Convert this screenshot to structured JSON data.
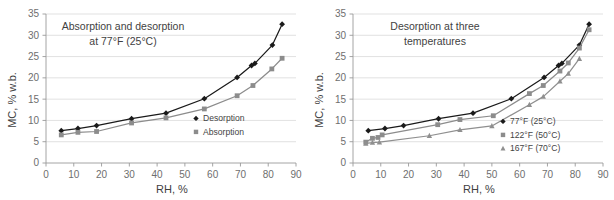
{
  "figure": {
    "width": 614,
    "height": 200,
    "background": "#ffffff"
  },
  "chart_data": [
    {
      "type": "line",
      "panel": "left",
      "title": "Absorption and desorption\nat 77°F (25°C)",
      "title_line1": "Absorption and desorption",
      "title_line2": "at 77°F (25°C)",
      "xlabel": "RH, %",
      "ylabel": "MC, % w.b.",
      "xlim": [
        0,
        90
      ],
      "ylim": [
        0,
        35
      ],
      "xticks": [
        0,
        10,
        20,
        30,
        40,
        50,
        60,
        70,
        80,
        90
      ],
      "yticks": [
        0,
        5,
        10,
        15,
        20,
        25,
        30,
        35
      ],
      "grid": "horizontal",
      "legend_position": "inside-lower-right",
      "series": [
        {
          "name": "Desorption",
          "marker": "diamond",
          "color": "#1a1a1a",
          "points": [
            [
              5.5,
              7.6
            ],
            [
              11.5,
              8.1
            ],
            [
              18.2,
              8.8
            ],
            [
              30.8,
              10.4
            ],
            [
              43.2,
              11.7
            ],
            [
              57.0,
              15.1
            ],
            [
              68.8,
              20.1
            ],
            [
              74.0,
              22.9
            ],
            [
              75.2,
              23.4
            ],
            [
              81.5,
              27.7
            ],
            [
              85.0,
              32.6
            ]
          ]
        },
        {
          "name": "Absorption",
          "marker": "square",
          "color": "#8c8c8c",
          "points": [
            [
              5.5,
              6.6
            ],
            [
              11.5,
              7.2
            ],
            [
              18.2,
              7.4
            ],
            [
              30.8,
              9.4
            ],
            [
              43.2,
              10.6
            ],
            [
              57.0,
              12.7
            ],
            [
              68.8,
              15.8
            ],
            [
              74.5,
              18.2
            ],
            [
              81.3,
              22.1
            ],
            [
              85.0,
              24.6
            ]
          ]
        }
      ]
    },
    {
      "type": "line",
      "panel": "right",
      "title": "Desorption at three\ntemperatures",
      "title_line1": "Desorption at three",
      "title_line2": "temperatures",
      "xlabel": "RH, %",
      "ylabel": "MC, % w.b.",
      "xlim": [
        0,
        90
      ],
      "ylim": [
        0,
        35
      ],
      "xticks": [
        0,
        10,
        20,
        30,
        40,
        50,
        60,
        70,
        80,
        90
      ],
      "yticks": [
        0,
        5,
        10,
        15,
        20,
        25,
        30,
        35
      ],
      "grid": "horizontal",
      "legend_position": "inside-lower-right",
      "series": [
        {
          "name": "77°F (25°C)",
          "marker": "diamond",
          "color": "#1a1a1a",
          "points": [
            [
              5.5,
              7.6
            ],
            [
              11.5,
              8.1
            ],
            [
              18.2,
              8.8
            ],
            [
              30.8,
              10.4
            ],
            [
              43.2,
              11.7
            ],
            [
              57.0,
              15.1
            ],
            [
              68.8,
              20.1
            ],
            [
              74.0,
              22.9
            ],
            [
              75.2,
              23.4
            ],
            [
              81.5,
              27.7
            ],
            [
              85.0,
              32.6
            ]
          ]
        },
        {
          "name": "122°F (50°C)",
          "marker": "square",
          "color": "#8c8c8c",
          "points": [
            [
              4.6,
              4.9
            ],
            [
              7.0,
              5.8
            ],
            [
              9.0,
              6.0
            ],
            [
              10.5,
              6.6
            ],
            [
              30.5,
              9.0
            ],
            [
              38.5,
              10.2
            ],
            [
              50.5,
              11.1
            ],
            [
              63.5,
              16.3
            ],
            [
              68.5,
              18.2
            ],
            [
              74.5,
              21.6
            ],
            [
              77.5,
              23.5
            ],
            [
              81.5,
              27.0
            ],
            [
              85.0,
              31.3
            ]
          ]
        },
        {
          "name": "167°F (70°C)",
          "marker": "triangle",
          "color": "#8f8f8f",
          "points": [
            [
              4.6,
              4.6
            ],
            [
              7.0,
              4.8
            ],
            [
              9.5,
              4.9
            ],
            [
              27.5,
              6.4
            ],
            [
              38.5,
              7.8
            ],
            [
              50.0,
              8.7
            ],
            [
              63.5,
              13.7
            ],
            [
              68.5,
              15.6
            ],
            [
              74.5,
              19.2
            ],
            [
              77.5,
              21.0
            ],
            [
              81.5,
              24.5
            ]
          ]
        }
      ]
    }
  ]
}
